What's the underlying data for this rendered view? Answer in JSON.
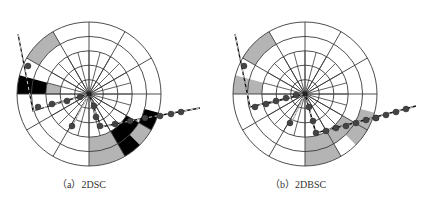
{
  "figure": {
    "rings": [
      14.4,
      28.8,
      43.2,
      57.6,
      72
    ],
    "inner_spokes": {
      "count": 24,
      "to_radius": 43.2
    },
    "outer_spokes": {
      "count": 12,
      "to_radius": 72
    },
    "colors": {
      "grid": "#3a3a3a",
      "gray": "#b4b4b4",
      "black": "#000000",
      "line": "#111111",
      "dot": "#444444",
      "dash": "#ffffff"
    }
  },
  "panels": [
    {
      "id": "a",
      "caption": "（a）2DSC",
      "center": [
        89,
        94
      ],
      "caption_pos": [
        57,
        176
      ],
      "sectors": [
        {
          "r0": 57.6,
          "r1": 72,
          "a0": 210,
          "a1": 240,
          "fill": "gray"
        },
        {
          "r0": 43.2,
          "r1": 57.6,
          "a0": 180,
          "a1": 195,
          "fill": "black"
        },
        {
          "r0": 57.6,
          "r1": 72,
          "a0": 180,
          "a1": 195,
          "fill": "black"
        },
        {
          "r0": 28.8,
          "r1": 43.2,
          "a0": 180,
          "a1": 195,
          "fill": "gray"
        },
        {
          "r0": 43.2,
          "r1": 72,
          "a0": 60,
          "a1": 90,
          "fill": "gray"
        },
        {
          "r0": 43.2,
          "r1": 57.6,
          "a0": 30,
          "a1": 60,
          "fill": "black"
        },
        {
          "r0": 57.6,
          "r1": 72,
          "a0": 30,
          "a1": 45,
          "fill": "gray"
        },
        {
          "r0": 57.6,
          "r1": 72,
          "a0": 15,
          "a1": 30,
          "fill": "black"
        },
        {
          "r0": 57.6,
          "r1": 72,
          "a0": 45,
          "a1": 60,
          "fill": "black"
        }
      ],
      "polylines": [
        {
          "points": [
            [
              18,
              34
            ],
            [
              33,
              111
            ],
            [
              89,
              94
            ]
          ],
          "style": "solid-dashed"
        },
        {
          "points": [
            [
              89,
              94
            ],
            [
              101,
              127
            ],
            [
              140,
              119
            ],
            [
              200,
              108
            ]
          ],
          "style": "solid-dashed"
        },
        {
          "points": [
            [
              89,
              94
            ],
            [
              70,
              130
            ]
          ],
          "style": "dashed-only"
        }
      ],
      "dots": [
        [
          28,
          66
        ],
        [
          38,
          107
        ],
        [
          52,
          104
        ],
        [
          67,
          101
        ],
        [
          80,
          97
        ],
        [
          94,
          106
        ],
        [
          96,
          117
        ],
        [
          100,
          126
        ],
        [
          115,
          124
        ],
        [
          130,
          121
        ],
        [
          145,
          118
        ],
        [
          160,
          116
        ],
        [
          171,
          114
        ],
        [
          181,
          112
        ],
        [
          72,
          126
        ]
      ]
    },
    {
      "id": "b",
      "caption": "（b）2DBSC",
      "center": [
        305,
        94
      ],
      "caption_pos": [
        270,
        176
      ],
      "sectors": [
        {
          "r0": 57.6,
          "r1": 72,
          "a0": 210,
          "a1": 240,
          "fill": "gray"
        },
        {
          "r0": 43.2,
          "r1": 72,
          "a0": 180,
          "a1": 195,
          "fill": "gray"
        },
        {
          "r0": 43.2,
          "r1": 72,
          "a0": 60,
          "a1": 90,
          "fill": "gray"
        },
        {
          "r0": 43.2,
          "r1": 57.6,
          "a0": 30,
          "a1": 60,
          "fill": "gray"
        },
        {
          "r0": 57.6,
          "r1": 72,
          "a0": 15,
          "a1": 45,
          "fill": "gray"
        }
      ],
      "polylines": [
        {
          "points": [
            [
              235,
              34
            ],
            [
              250,
              107
            ],
            [
              305,
              94
            ]
          ],
          "style": "solid-dashed"
        },
        {
          "points": [
            [
              305,
              94
            ],
            [
              316,
              133
            ],
            [
              350,
              124
            ],
            [
              416,
              106
            ]
          ],
          "style": "solid-dashed"
        },
        {
          "points": [
            [
              305,
              94
            ],
            [
              290,
              126
            ]
          ],
          "style": "dashed-only"
        }
      ],
      "dots": [
        [
          244,
          66
        ],
        [
          255,
          107
        ],
        [
          266,
          104
        ],
        [
          276,
          101
        ],
        [
          286,
          98
        ],
        [
          296,
          95
        ],
        [
          309,
          107
        ],
        [
          313,
          121
        ],
        [
          316,
          133
        ],
        [
          326,
          131
        ],
        [
          336,
          128
        ],
        [
          346,
          126
        ],
        [
          356,
          123
        ],
        [
          366,
          120
        ],
        [
          376,
          118
        ],
        [
          376,
          118
        ],
        [
          386,
          115
        ],
        [
          396,
          112
        ],
        [
          406,
          109
        ],
        [
          290,
          123
        ]
      ]
    }
  ]
}
